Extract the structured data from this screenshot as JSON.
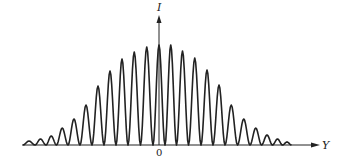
{
  "figure": {
    "y_axis_label": "I",
    "x_axis_label": "Y",
    "origin_label": "0",
    "line_color": "#222222",
    "background": "#ffffff"
  },
  "chart_data": {
    "type": "line",
    "title": "",
    "xlabel": "Y",
    "ylabel": "I",
    "origin_tick": "0",
    "grid": false,
    "legend": null,
    "relative_units": true,
    "peaks": {
      "x": [
        -11,
        -10,
        -9,
        -8,
        -7,
        -6,
        -5,
        -4,
        -3,
        -2,
        -1,
        0,
        1,
        2,
        3,
        4,
        5,
        6,
        7,
        8,
        9,
        10,
        11
      ],
      "intensity_pct": [
        4,
        6,
        9,
        17,
        26,
        40,
        59,
        74,
        86,
        93,
        98,
        100,
        100,
        94,
        87,
        75,
        60,
        40,
        26,
        17,
        10,
        6,
        3
      ]
    },
    "pixel_geometry": {
      "baseline_y": 145,
      "peak_scale_px": 100,
      "axis_x": 159,
      "fringe_spacing_px": 12,
      "peak_x_px": [
        29,
        41,
        51,
        62,
        74,
        86,
        98,
        110,
        122,
        134,
        147,
        159,
        171,
        182,
        195,
        207,
        219,
        231,
        244,
        256,
        267,
        278,
        287
      ]
    }
  }
}
